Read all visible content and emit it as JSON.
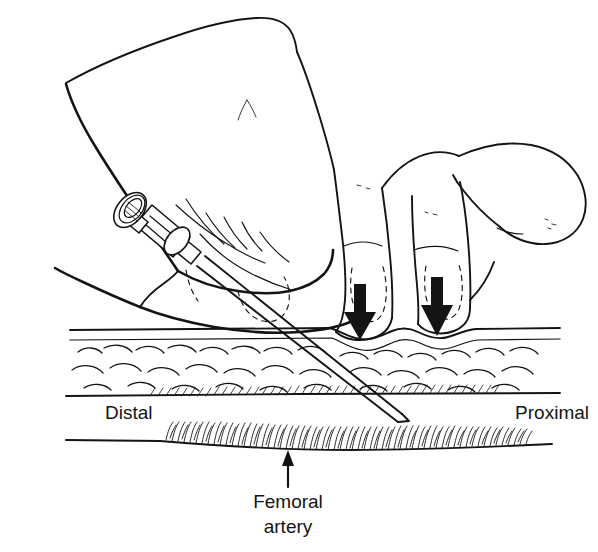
{
  "figure": {
    "title": "Femoral artery puncture technique",
    "background_color": "#ffffff",
    "ink_color": "#141414"
  },
  "labels": {
    "distal": {
      "text": "Distal",
      "x": 105,
      "y": 419,
      "anchor": "start"
    },
    "proximal": {
      "text": "Proximal",
      "x": 589,
      "y": 419,
      "anchor": "end"
    },
    "femoral_artery_line1": {
      "text": "Femoral",
      "x": 288,
      "y": 508,
      "anchor": "middle"
    },
    "femoral_artery_line2": {
      "text": "artery",
      "x": 288,
      "y": 533,
      "anchor": "middle"
    }
  },
  "annotations": {
    "pointer_arrow": {
      "name": "femoral-artery-pointer-arrow",
      "direction": "up",
      "from_x": 288,
      "from_y": 486,
      "to_x": 288,
      "to_y": 452
    },
    "pressure_arrow_index": {
      "name": "pressure-arrow-index-finger",
      "direction": "down",
      "x": 360,
      "top_y": 284,
      "tip_y": 338
    },
    "pressure_arrow_middle": {
      "name": "pressure-arrow-middle-finger",
      "direction": "down",
      "x": 437,
      "top_y": 277,
      "tip_y": 336
    }
  },
  "anatomy": {
    "skin_surface_label": "skin surface",
    "subcutaneous_fat_label": "subcutaneous fat",
    "muscle_fascia_label": "muscle / fascia",
    "artery_label": "femoral artery"
  },
  "instrument": {
    "name": "syringe with needle",
    "parts": [
      "plunger-disc",
      "plunger-rod",
      "barrel",
      "flange",
      "hub",
      "needle-shaft",
      "needle-tip"
    ],
    "insertion_angle_degrees": 35
  }
}
